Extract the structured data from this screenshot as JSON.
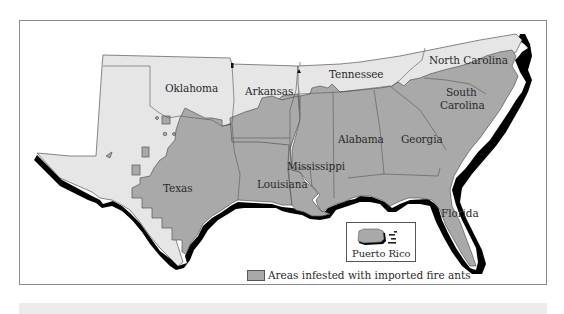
{
  "map": {
    "subject": "Imported fire ant infestation, southern United States",
    "colors": {
      "infested": "#a9a9a9",
      "not_infested": "#e6e6e6",
      "coastline": "#000000",
      "border": "#555555",
      "frame": "#8a8a8a",
      "bottom_bar": "#ececec"
    },
    "states": [
      {
        "name": "Oklahoma",
        "status": "partially infested"
      },
      {
        "name": "Arkansas",
        "status": "partially infested"
      },
      {
        "name": "Tennessee",
        "status": "partially infested"
      },
      {
        "name": "North Carolina",
        "status": "partially infested"
      },
      {
        "name": "South Carolina",
        "status": "infested"
      },
      {
        "name": "Texas",
        "status": "partially infested"
      },
      {
        "name": "Louisiana",
        "status": "infested"
      },
      {
        "name": "Mississippi",
        "status": "infested"
      },
      {
        "name": "Alabama",
        "status": "infested"
      },
      {
        "name": "Georgia",
        "status": "infested"
      },
      {
        "name": "Florida",
        "status": "infested"
      }
    ],
    "labels": {
      "oklahoma": "Oklahoma",
      "arkansas": "Arkansas",
      "tennessee": "Tennessee",
      "north_carolina": "North Carolina",
      "south_carolina_1": "South",
      "south_carolina_2": "Carolina",
      "texas": "Texas",
      "louisiana": "Louisiana",
      "mississippi": "Mississippi",
      "alabama": "Alabama",
      "georgia": "Georgia",
      "florida": "Florida"
    },
    "inset": {
      "label": "Puerto Rico",
      "status": "infested"
    },
    "legend": {
      "label": "Areas infested with imported fire ants"
    }
  }
}
